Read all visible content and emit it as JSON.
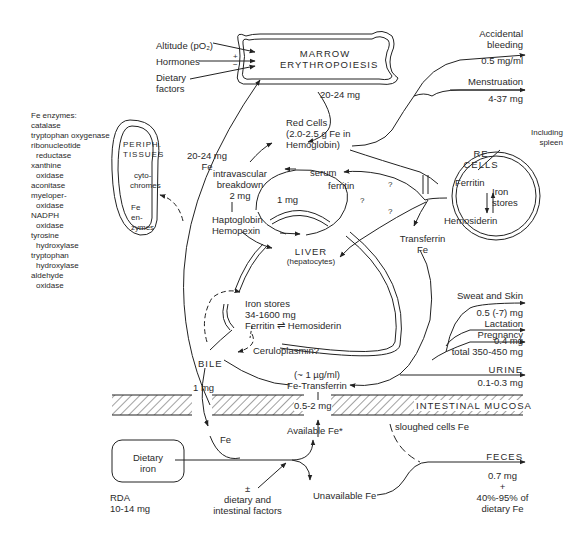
{
  "diagram": {
    "type": "iron metabolism flow diagram",
    "nodes": {
      "marrow": {
        "line1": "MARROW",
        "line2": "ERYTHROPOIESIS"
      },
      "regulators": {
        "altitude": "Altitude (pO₂)",
        "hormones": "Hormones",
        "dietary_line1": "Dietary",
        "dietary_line2": "factors",
        "sign_plus": "+",
        "sign_minus": "−"
      },
      "marrow_output": "20-24 mg",
      "red_cells": {
        "line1": "Red Cells",
        "line2": "(2.0-2.5 g Fe in",
        "line3": "Hemoglobin)"
      },
      "periph": {
        "line1": "PERIPH.",
        "line2": "TISSUES",
        "cyto1": "cyto-",
        "cyto2": "chromes",
        "fe1": "Fe",
        "fe2": "en-",
        "fe3": "zymes"
      },
      "fe_enzymes": {
        "title": "Fe enzymes:",
        "items": [
          "catalase",
          "tryptophan oxygenase",
          "ribonucleotide",
          "  reductase",
          "xanthine",
          "  oxidase",
          "aconitase",
          "myeloper-",
          "  oxidase",
          "NADPH",
          "  oxidase",
          "tyrosine",
          "  hydroxylase",
          "tryptophan",
          "  hydroxylase",
          "aldehyde",
          "  oxidase"
        ]
      },
      "to_marrow": {
        "line1": "20-24 mg",
        "line2": "Fe"
      },
      "intravascular": {
        "line1": "intravascular",
        "line2": "breakdown",
        "line3": "2 mg"
      },
      "haptoglobin": {
        "line1": "Haptoglobin",
        "line2": "Hemopexin"
      },
      "serum": {
        "line1": "serum",
        "line2": "ferritin"
      },
      "one_mg": "1 mg",
      "question": "?",
      "liver": {
        "line1": "LIVER",
        "line2": "(hepatocytes)"
      },
      "re_cells": {
        "line1": "RE",
        "line2": "CELLS",
        "ferritin": "Ferritin",
        "iron1": "Iron",
        "iron2": "stores",
        "hemosiderin": "Hemosiderin",
        "including1": "Including",
        "including2": "spleen"
      },
      "transferrin": {
        "line1": "Transferrin",
        "line2": "Fe"
      },
      "iron_stores": {
        "line1": "Iron stores",
        "line2": "34-1600 mg",
        "line3": "Ferritin ⇌ Hemosiderin"
      },
      "ceruloplasmin": "Ceruloplasmin?",
      "bile": "BILE",
      "bile_amount": "1 mg",
      "fe_transferrin": {
        "line1": "(~ 1 µg/ml)",
        "line2": "Fe-Transferrin"
      },
      "absorption": "0.5-2 mg",
      "mucosa": "INTESTINAL MUCOSA",
      "available": "Available Fe*",
      "sloughed": "sloughed cells Fe",
      "fe_label": "Fe",
      "dietary_iron": {
        "line1": "Dietary",
        "line2": "iron"
      },
      "rda": {
        "line1": "RDA",
        "line2": "10-14 mg"
      },
      "factors": {
        "sign": "±",
        "line1": "dietary and",
        "line2": "intestinal factors"
      },
      "unavailable": "Unavailable Fe"
    },
    "losses": [
      {
        "name": "Accidental",
        "name2": "bleeding",
        "value": "0.5 mg/ml"
      },
      {
        "name": "Menstruation",
        "value": "4-37 mg"
      },
      {
        "name": "Sweat and Skin",
        "value": "0.5 (-7) mg"
      },
      {
        "name": "Lactation",
        "value": "0.4 mg"
      },
      {
        "name": "Pregnancy",
        "value": "total 350-450 mg"
      },
      {
        "name": "URINE",
        "value": "0.1-0.3 mg"
      },
      {
        "name": "FECES",
        "value": "0.7 mg",
        "value2": "+",
        "value3": "40%-95% of",
        "value4": "dietary Fe"
      }
    ]
  }
}
